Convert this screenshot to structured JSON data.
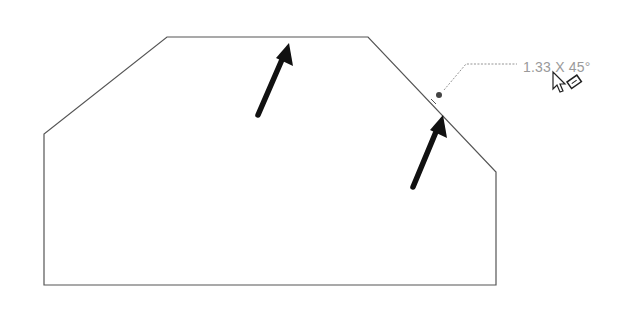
{
  "sketch": {
    "outline_color": "#555555",
    "outline_points": [
      [
        44,
        285
      ],
      [
        44,
        134
      ],
      [
        167,
        37
      ],
      [
        368,
        37
      ],
      [
        496,
        172
      ],
      [
        496,
        285
      ]
    ],
    "arrow_color": "#111111",
    "arrows": [
      {
        "name": "top-edge-arrow",
        "from": [
          258,
          115
        ],
        "to": [
          289,
          44
        ]
      },
      {
        "name": "chamfer-edge-arrow",
        "from": [
          413,
          187
        ],
        "to": [
          443,
          115
        ]
      }
    ],
    "chamfer_preview": {
      "marker": [
        438,
        95
      ],
      "leader_points": [
        [
          444,
          90
        ],
        [
          466,
          64
        ],
        [
          517,
          64
        ]
      ],
      "label": "1.33 X 45°",
      "label_color": "#9a9a9a"
    },
    "cursor": {
      "icon": "pointer-with-chamfer-tool-icon",
      "position": [
        553,
        73
      ]
    }
  }
}
